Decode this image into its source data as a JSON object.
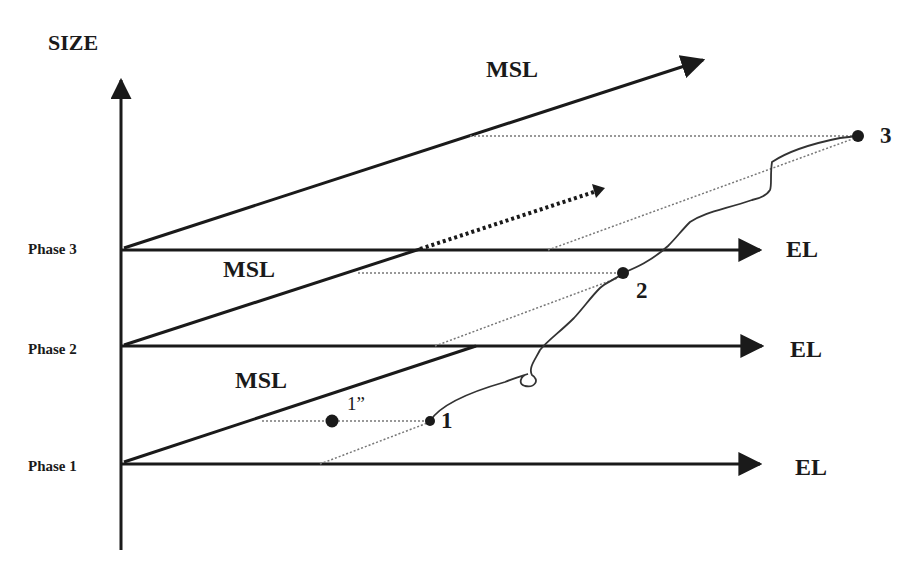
{
  "diagram": {
    "axis_title": "SIZE",
    "phases": [
      {
        "label": "Phase 1"
      },
      {
        "label": "Phase 2"
      },
      {
        "label": "Phase 3"
      }
    ],
    "msl_labels": [
      "MSL",
      "MSL",
      "MSL"
    ],
    "el_labels": [
      "EL",
      "EL",
      "EL"
    ],
    "points": [
      {
        "label": "1"
      },
      {
        "label": "1”"
      },
      {
        "label": "2"
      },
      {
        "label": "3"
      }
    ],
    "colors": {
      "line": "#1a1a1a",
      "dotted": "#777777",
      "background": "#ffffff"
    }
  }
}
